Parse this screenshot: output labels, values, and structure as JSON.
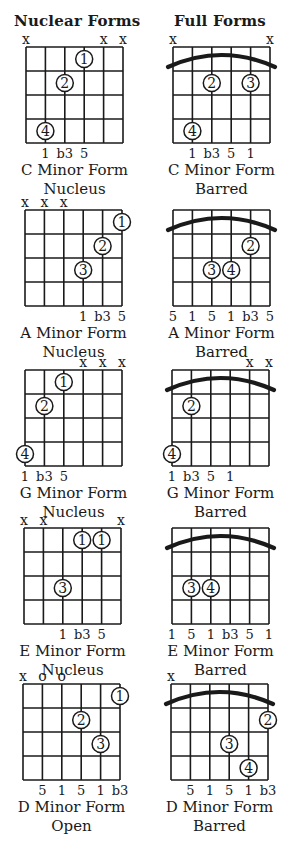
{
  "headers": {
    "left": "Nuclear Forms",
    "right": "Full Forms"
  },
  "colors": {
    "ink": "#1a1a1a",
    "background": "#ffffff"
  },
  "diagrams": [
    {
      "id": "c-minor-nucleus",
      "column": "left",
      "grid": {
        "x": 26,
        "y": 47
      },
      "title": "C Minor Form",
      "subtitle": "Nucleus",
      "markers": [
        {
          "string": 0,
          "symbol": "x"
        },
        {
          "string": 4,
          "symbol": "x"
        },
        {
          "string": 5,
          "symbol": "x"
        }
      ],
      "barre": false,
      "fingers": [
        {
          "string": 3,
          "fret": 1,
          "label": "1"
        },
        {
          "string": 2,
          "fret": 2,
          "label": "2"
        },
        {
          "string": 1,
          "fret": 4,
          "label": "4"
        }
      ],
      "intervals": [
        {
          "string": 1,
          "label": "1"
        },
        {
          "string": 2,
          "label": "b3"
        },
        {
          "string": 3,
          "label": "5"
        }
      ]
    },
    {
      "id": "c-minor-barred",
      "column": "right",
      "grid": {
        "x": 173,
        "y": 47
      },
      "title": "C Minor Form",
      "subtitle": "Barred",
      "markers": [
        {
          "string": 0,
          "symbol": "x"
        },
        {
          "string": 5,
          "symbol": "x"
        }
      ],
      "barre": true,
      "fingers": [
        {
          "string": 2,
          "fret": 2,
          "label": "2"
        },
        {
          "string": 4,
          "fret": 2,
          "label": "3"
        },
        {
          "string": 1,
          "fret": 4,
          "label": "4"
        }
      ],
      "intervals": [
        {
          "string": 1,
          "label": "1"
        },
        {
          "string": 2,
          "label": "b3"
        },
        {
          "string": 3,
          "label": "5"
        },
        {
          "string": 4,
          "label": "1"
        }
      ]
    },
    {
      "id": "a-minor-nucleus",
      "column": "left",
      "grid": {
        "x": 25,
        "y": 210
      },
      "title": "A Minor Form",
      "subtitle": "Nucleus",
      "markers": [
        {
          "string": 0,
          "symbol": "x"
        },
        {
          "string": 1,
          "symbol": "x"
        },
        {
          "string": 2,
          "symbol": "x"
        }
      ],
      "barre": false,
      "fingers": [
        {
          "string": 5,
          "fret": 1,
          "label": "1"
        },
        {
          "string": 4,
          "fret": 2,
          "label": "2"
        },
        {
          "string": 3,
          "fret": 3,
          "label": "3"
        }
      ],
      "intervals": [
        {
          "string": 3,
          "label": "1"
        },
        {
          "string": 4,
          "label": "b3"
        },
        {
          "string": 5,
          "label": "5"
        }
      ]
    },
    {
      "id": "a-minor-barred",
      "column": "right",
      "grid": {
        "x": 173,
        "y": 210
      },
      "title": "A Minor Form",
      "subtitle": "Barred",
      "markers": [],
      "barre": true,
      "fingers": [
        {
          "string": 4,
          "fret": 2,
          "label": "2"
        },
        {
          "string": 2,
          "fret": 3,
          "label": "3"
        },
        {
          "string": 3,
          "fret": 3,
          "label": "4"
        }
      ],
      "intervals": [
        {
          "string": 0,
          "label": "5"
        },
        {
          "string": 1,
          "label": "1"
        },
        {
          "string": 2,
          "label": "5"
        },
        {
          "string": 3,
          "label": "1"
        },
        {
          "string": 4,
          "label": "b3"
        },
        {
          "string": 5,
          "label": "5"
        }
      ]
    },
    {
      "id": "g-minor-nucleus",
      "column": "left",
      "grid": {
        "x": 25,
        "y": 370
      },
      "title": "G Minor Form",
      "subtitle": "Nucleus",
      "markers": [
        {
          "string": 3,
          "symbol": "x"
        },
        {
          "string": 4,
          "symbol": "x"
        },
        {
          "string": 5,
          "symbol": "x"
        }
      ],
      "barre": false,
      "fingers": [
        {
          "string": 2,
          "fret": 1,
          "label": "1"
        },
        {
          "string": 1,
          "fret": 2,
          "label": "2"
        },
        {
          "string": 0,
          "fret": 4,
          "label": "4"
        }
      ],
      "intervals": [
        {
          "string": 0,
          "label": "1"
        },
        {
          "string": 1,
          "label": "b3"
        },
        {
          "string": 2,
          "label": "5"
        }
      ]
    },
    {
      "id": "g-minor-barred",
      "column": "right",
      "grid": {
        "x": 172,
        "y": 370
      },
      "title": "G Minor Form",
      "subtitle": "Barred",
      "markers": [
        {
          "string": 4,
          "symbol": "x"
        },
        {
          "string": 5,
          "symbol": "x"
        }
      ],
      "barre": true,
      "fingers": [
        {
          "string": 1,
          "fret": 2,
          "label": "2"
        },
        {
          "string": 0,
          "fret": 4,
          "label": "4"
        }
      ],
      "intervals": [
        {
          "string": 0,
          "label": "1"
        },
        {
          "string": 1,
          "label": "b3"
        },
        {
          "string": 2,
          "label": "5"
        },
        {
          "string": 3,
          "label": "1"
        }
      ]
    },
    {
      "id": "e-minor-nucleus",
      "column": "left",
      "grid": {
        "x": 24,
        "y": 528
      },
      "title": "E Minor Form",
      "subtitle": "Nucleus",
      "markers": [
        {
          "string": 0,
          "symbol": "x"
        },
        {
          "string": 1,
          "symbol": "x"
        },
        {
          "string": 5,
          "symbol": "x"
        }
      ],
      "barre": false,
      "fingers": [
        {
          "string": 3,
          "fret": 1,
          "label": "1"
        },
        {
          "string": 4,
          "fret": 1,
          "label": "1"
        },
        {
          "string": 2,
          "fret": 3,
          "label": "3"
        }
      ],
      "intervals": [
        {
          "string": 2,
          "label": "1"
        },
        {
          "string": 3,
          "label": "b3"
        },
        {
          "string": 4,
          "label": "5"
        }
      ]
    },
    {
      "id": "e-minor-barred",
      "column": "right",
      "grid": {
        "x": 172,
        "y": 528
      },
      "title": "E Minor Form",
      "subtitle": "Barred",
      "markers": [],
      "barre": true,
      "fingers": [
        {
          "string": 1,
          "fret": 3,
          "label": "3"
        },
        {
          "string": 2,
          "fret": 3,
          "label": "4"
        }
      ],
      "intervals": [
        {
          "string": 0,
          "label": "1"
        },
        {
          "string": 1,
          "label": "5"
        },
        {
          "string": 2,
          "label": "1"
        },
        {
          "string": 3,
          "label": "b3"
        },
        {
          "string": 4,
          "label": "5"
        },
        {
          "string": 5,
          "label": "1"
        }
      ]
    },
    {
      "id": "d-minor-open",
      "column": "left",
      "grid": {
        "x": 23,
        "y": 684
      },
      "title": "D Minor Form",
      "subtitle": "Open",
      "markers": [
        {
          "string": 0,
          "symbol": "x"
        },
        {
          "string": 1,
          "symbol": "o"
        },
        {
          "string": 2,
          "symbol": "o"
        }
      ],
      "barre": false,
      "fingers": [
        {
          "string": 5,
          "fret": 1,
          "label": "1"
        },
        {
          "string": 3,
          "fret": 2,
          "label": "2"
        },
        {
          "string": 4,
          "fret": 3,
          "label": "3"
        }
      ],
      "intervals": [
        {
          "string": 1,
          "label": "5"
        },
        {
          "string": 2,
          "label": "1"
        },
        {
          "string": 3,
          "label": "5"
        },
        {
          "string": 4,
          "label": "1"
        },
        {
          "string": 5,
          "label": "b3"
        }
      ]
    },
    {
      "id": "d-minor-barred",
      "column": "right",
      "grid": {
        "x": 171,
        "y": 684
      },
      "title": "D Minor Form",
      "subtitle": "Barred",
      "markers": [
        {
          "string": 0,
          "symbol": "x"
        }
      ],
      "barre": true,
      "fingers": [
        {
          "string": 5,
          "fret": 2,
          "label": "2"
        },
        {
          "string": 3,
          "fret": 3,
          "label": "3"
        },
        {
          "string": 4,
          "fret": 4,
          "label": "4"
        }
      ],
      "intervals": [
        {
          "string": 1,
          "label": "5"
        },
        {
          "string": 2,
          "label": "1"
        },
        {
          "string": 3,
          "label": "5"
        },
        {
          "string": 4,
          "label": "1"
        },
        {
          "string": 5,
          "label": "b3"
        }
      ]
    }
  ]
}
